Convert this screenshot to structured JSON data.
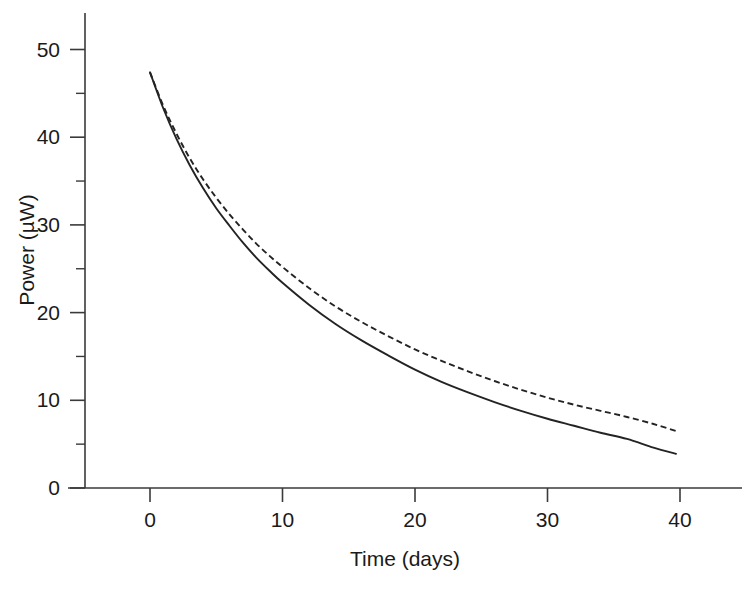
{
  "chart_data": {
    "type": "line",
    "title": "",
    "xlabel": "Time (days)",
    "ylabel": "Power (µW)",
    "xlim": [
      -5,
      44
    ],
    "ylim": [
      0,
      53
    ],
    "xticks": [
      0,
      10,
      20,
      30,
      40
    ],
    "xticklabels": [
      "0",
      "10",
      "20",
      "30",
      "40"
    ],
    "yticks": [
      0,
      10,
      20,
      30,
      40,
      50
    ],
    "yticklabels": [
      "0",
      "10",
      "20",
      "30",
      "40",
      "50"
    ],
    "y_minor_ticks": [
      5,
      15,
      25,
      35,
      45
    ],
    "grid": false,
    "legend": "none",
    "x": [
      0,
      1,
      2,
      3,
      4,
      5,
      6,
      7,
      8,
      9,
      10,
      12,
      14,
      16,
      18,
      20,
      22,
      24,
      26,
      28,
      30,
      32,
      34,
      36,
      38,
      39.7
    ],
    "series": [
      {
        "name": "solid-curve",
        "style": "solid",
        "color": "#232323",
        "values": [
          47.4,
          43.3,
          39.8,
          36.8,
          34.2,
          31.9,
          29.9,
          28.0,
          26.3,
          24.8,
          23.4,
          20.9,
          18.7,
          16.8,
          15.1,
          13.5,
          12.1,
          10.9,
          9.8,
          8.8,
          7.9,
          7.1,
          6.3,
          5.6,
          4.6,
          3.9
        ]
      },
      {
        "name": "dashed-curve",
        "style": "dashed",
        "color": "#232323",
        "values": [
          47.4,
          43.6,
          40.4,
          37.6,
          35.2,
          33.1,
          31.2,
          29.5,
          27.9,
          26.5,
          25.2,
          22.8,
          20.7,
          18.9,
          17.3,
          15.8,
          14.5,
          13.3,
          12.2,
          11.2,
          10.3,
          9.5,
          8.8,
          8.1,
          7.3,
          6.5
        ]
      }
    ],
    "axis_pixel_mapping": {
      "x_origin_px": 150,
      "x_unit_px": 13.25,
      "y_origin_px": 488,
      "y_unit_px": 8.77
    }
  }
}
